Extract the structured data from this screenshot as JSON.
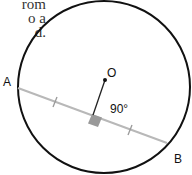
{
  "caption": {
    "lines": [
      "rom",
      "o a",
      "d."
    ]
  },
  "diagram": {
    "circle": {
      "cx": 104,
      "cy": 87,
      "r": 87,
      "stroke": "#111111"
    },
    "chord": {
      "from_label": "A",
      "to_label": "B",
      "color": "#b8b8b8"
    },
    "center_label": "O",
    "angle_label": "90°",
    "right_angle_color": "#999999"
  }
}
